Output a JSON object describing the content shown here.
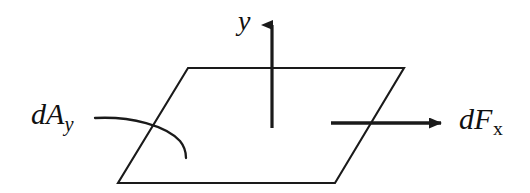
{
  "figure": {
    "name": "differential-area-force-diagram",
    "background_color": "#ffffff",
    "stroke_color": "#1a1a1a",
    "labels": {
      "y_axis": {
        "symbol": "y"
      },
      "area_element": {
        "symbol": "dA",
        "subscript": "y"
      },
      "force_element": {
        "symbol": "dF",
        "subscript": "x"
      }
    },
    "geometry": {
      "plane_vertices": [
        [
          188,
          68
        ],
        [
          404,
          68
        ],
        [
          335,
          183
        ],
        [
          118,
          183
        ]
      ],
      "y_arrow": {
        "from": [
          272,
          128
        ],
        "to": [
          272,
          13
        ]
      },
      "force_arrow": {
        "from": [
          331,
          123
        ],
        "to": [
          452,
          123
        ]
      },
      "leader_curve": {
        "from": [
          95,
          118
        ],
        "to": [
          186,
          158
        ]
      }
    }
  }
}
